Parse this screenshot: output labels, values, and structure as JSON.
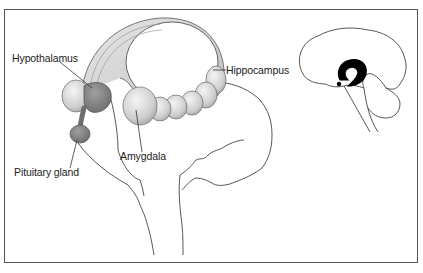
{
  "figure": {
    "labels": {
      "hypothalamus": "Hypothalamus",
      "hippocampus": "Hippocampus",
      "amygdala": "Amygdala",
      "pituitary": "Pituitary gland"
    },
    "colors": {
      "frame": "#555555",
      "outline": "#444444",
      "structure_fill": "#d9d9d9",
      "structure_dark": "#8a8a8a",
      "inset_highlight": "#000000"
    }
  }
}
